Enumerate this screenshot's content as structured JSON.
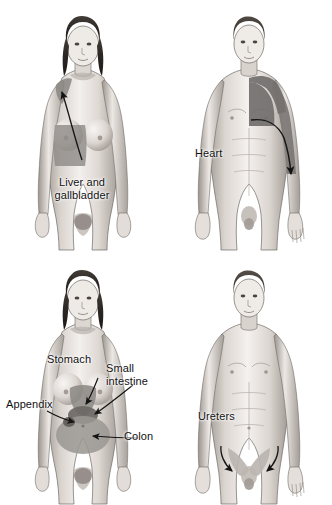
{
  "illustration": {
    "title": "Referred pain patterns",
    "background_color": "#ffffff",
    "panel_count": 4,
    "layout": "2x2 grid",
    "style": "grayscale medical illustration"
  },
  "colors": {
    "skin_light": "#f2efec",
    "skin_mid": "#cfc9c4",
    "skin_shadow": "#9a938d",
    "outline": "#6f6a66",
    "hair_dark": "#2e2a27",
    "hair_mid": "#4a443f",
    "shade_liver": "#8f8b88",
    "shade_heart": "#6f6c6a",
    "shade_stomach": "#8b8783",
    "shade_small_intestine": "#6b6764",
    "shade_colon": "#9a9692",
    "shade_ureter": "#b9b4af",
    "arrow": "#141414",
    "label_text": "#111111"
  },
  "panels": [
    {
      "id": "liver-gallbladder",
      "position": "top-left",
      "figure": "female",
      "organ": "Liver and gallbladder",
      "label_lines": [
        "Liver and",
        "gallbladder"
      ],
      "label_text": "Liver and gallbladder",
      "referral_region": "right upper quadrant and right shoulder",
      "arrow_count": 1,
      "arrow_direction": "from upper abdomen up to right shoulder"
    },
    {
      "id": "heart",
      "position": "top-right",
      "figure": "male",
      "organ": "Heart",
      "label_lines": [
        "Heart"
      ],
      "label_text": "Heart",
      "referral_region": "left chest, left shoulder and left arm",
      "arrow_count": 1,
      "arrow_direction": "curving down the left arm"
    },
    {
      "id": "abdominal-organs",
      "position": "bottom-left",
      "figure": "female",
      "organ": "Stomach, small intestine, appendix, colon",
      "labels": [
        {
          "id": "stomach",
          "text": "Stomach",
          "lines": [
            "Stomach"
          ]
        },
        {
          "id": "small-intestine",
          "text": "Small intestine",
          "lines": [
            "Small",
            "intestine"
          ]
        },
        {
          "id": "appendix",
          "text": "Appendix",
          "lines": [
            "Appendix"
          ]
        },
        {
          "id": "colon",
          "text": "Colon",
          "lines": [
            "Colon"
          ]
        }
      ],
      "arrow_count": 4
    },
    {
      "id": "ureters",
      "position": "bottom-right",
      "figure": "male",
      "organ": "Ureters",
      "label_lines": [
        "Ureters"
      ],
      "label_text": "Ureters",
      "referral_region": "bilateral groin / inguinal areas",
      "arrow_count": 2,
      "arrow_direction": "both curving down and inward toward the groin"
    }
  ],
  "labels": {
    "liver_line1": "Liver and",
    "liver_line2": "gallbladder",
    "liver_full": "Liver and gallbladder",
    "heart": "Heart",
    "stomach": "Stomach",
    "small_intestine": "Small intestine",
    "small_intestine_line1": "Small",
    "small_intestine_line2": "intestine",
    "appendix": "Appendix",
    "colon": "Colon",
    "ureters": "Ureters"
  }
}
